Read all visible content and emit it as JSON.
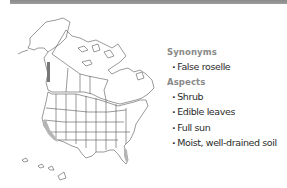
{
  "map": {
    "region": "North America",
    "description": "Distribution map of North America (Alaska, Canada, contiguous United States, Hawaii) with state/province boundaries; range shaded along the Pacific coast (California) and southern Florida"
  },
  "info": {
    "synonyms_heading": "Synonyms",
    "synonyms": [
      "False roselle"
    ],
    "aspects_heading": "Aspects",
    "aspects": [
      "Shrub",
      "Edible leaves",
      "Full sun",
      "Moist, well-drained soil"
    ],
    "bullet": "·"
  },
  "colors": {
    "top_bar": "#939393",
    "heading": "#8a8a8a",
    "text": "#2b2b2b",
    "map_line": "#555555",
    "map_shade": "#b5b5b5"
  }
}
